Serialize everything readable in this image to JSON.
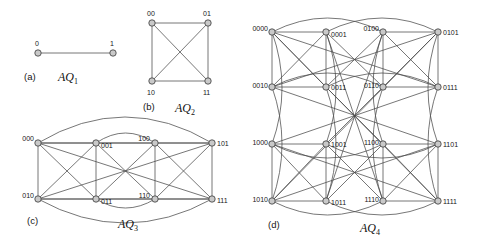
{
  "figure": {
    "background_color": "#ffffff",
    "edge_color": "#4a4a4a",
    "node_fill": "#c9c9c9",
    "node_stroke": "#3a3a3a",
    "label_color": "#161616"
  },
  "panels": [
    {
      "id": "aq1",
      "tag": "(a)",
      "name": "AQ",
      "subscript": "1",
      "dimension": 1,
      "origin": {
        "x": 0,
        "y": 0
      },
      "tag_pos": {
        "x": 24,
        "y": 80
      },
      "name_pos": {
        "x": 58,
        "y": 81
      },
      "nodes": [
        {
          "label": "0",
          "x": 38,
          "y": 53,
          "lx": 35,
          "ly": 46,
          "anchor": "start"
        },
        {
          "label": "1",
          "x": 113,
          "y": 53,
          "lx": 110,
          "ly": 46,
          "anchor": "start"
        }
      ],
      "edges": [
        {
          "from": 0,
          "to": 1,
          "bow": 0
        }
      ]
    },
    {
      "id": "aq2",
      "tag": "(b)",
      "name": "AQ",
      "subscript": "2",
      "dimension": 2,
      "origin": {
        "x": 0,
        "y": 0
      },
      "tag_pos": {
        "x": 143,
        "y": 110
      },
      "name_pos": {
        "x": 175,
        "y": 112
      },
      "nodes": [
        {
          "label": "00",
          "x": 152,
          "y": 23,
          "lx": 147,
          "ly": 16,
          "anchor": "start"
        },
        {
          "label": "01",
          "x": 208,
          "y": 23,
          "lx": 203,
          "ly": 16,
          "anchor": "start"
        },
        {
          "label": "10",
          "x": 152,
          "y": 81,
          "lx": 147,
          "ly": 95,
          "anchor": "start"
        },
        {
          "label": "11",
          "x": 208,
          "y": 81,
          "lx": 203,
          "ly": 95,
          "anchor": "start"
        }
      ],
      "edges": [
        {
          "from": 0,
          "to": 1,
          "bow": 0
        },
        {
          "from": 2,
          "to": 3,
          "bow": 0
        },
        {
          "from": 0,
          "to": 2,
          "bow": 0
        },
        {
          "from": 1,
          "to": 3,
          "bow": 0
        },
        {
          "from": 0,
          "to": 3,
          "bow": 0
        },
        {
          "from": 1,
          "to": 2,
          "bow": 0
        }
      ]
    },
    {
      "id": "aq3",
      "tag": "(c)",
      "name": "AQ",
      "subscript": "3",
      "dimension": 3,
      "origin": {
        "x": 0,
        "y": 0
      },
      "tag_pos": {
        "x": 27,
        "y": 224
      },
      "name_pos": {
        "x": 118,
        "y": 228
      },
      "nodes": [
        {
          "label": "000",
          "x": 38,
          "y": 143,
          "lx": 34,
          "ly": 141,
          "anchor": "end"
        },
        {
          "label": "001",
          "x": 96,
          "y": 143,
          "lx": 101,
          "ly": 148,
          "anchor": "start"
        },
        {
          "label": "100",
          "x": 155,
          "y": 143,
          "lx": 150,
          "ly": 141,
          "anchor": "end"
        },
        {
          "label": "101",
          "x": 212,
          "y": 143,
          "lx": 217,
          "ly": 146,
          "anchor": "start"
        },
        {
          "label": "010",
          "x": 38,
          "y": 199,
          "lx": 34,
          "ly": 198,
          "anchor": "end"
        },
        {
          "label": "011",
          "x": 96,
          "y": 199,
          "lx": 101,
          "ly": 204,
          "anchor": "start"
        },
        {
          "label": "110",
          "x": 155,
          "y": 199,
          "lx": 150,
          "ly": 198,
          "anchor": "end"
        },
        {
          "label": "111",
          "x": 212,
          "y": 199,
          "lx": 217,
          "ly": 203,
          "anchor": "start"
        }
      ],
      "edges": [
        {
          "from": 0,
          "to": 1,
          "bow": 0
        },
        {
          "from": 2,
          "to": 3,
          "bow": 0
        },
        {
          "from": 4,
          "to": 5,
          "bow": 0
        },
        {
          "from": 6,
          "to": 7,
          "bow": 0
        },
        {
          "from": 0,
          "to": 4,
          "bow": 0
        },
        {
          "from": 1,
          "to": 5,
          "bow": 0
        },
        {
          "from": 2,
          "to": 6,
          "bow": 0
        },
        {
          "from": 3,
          "to": 7,
          "bow": 0
        },
        {
          "from": 0,
          "to": 2,
          "bow": 0
        },
        {
          "from": 1,
          "to": 3,
          "bow": 0
        },
        {
          "from": 4,
          "to": 6,
          "bow": 0
        },
        {
          "from": 5,
          "to": 7,
          "bow": 0
        },
        {
          "from": 0,
          "to": 5,
          "bow": 0
        },
        {
          "from": 1,
          "to": 4,
          "bow": 0
        },
        {
          "from": 2,
          "to": 7,
          "bow": 0
        },
        {
          "from": 3,
          "to": 6,
          "bow": 0
        },
        {
          "from": 0,
          "to": 3,
          "bow": -26
        },
        {
          "from": 4,
          "to": 7,
          "bow": 24
        },
        {
          "from": 0,
          "to": 7,
          "bow": 0
        },
        {
          "from": 1,
          "to": 6,
          "bow": 0
        },
        {
          "from": 2,
          "to": 5,
          "bow": 0
        },
        {
          "from": 3,
          "to": 4,
          "bow": 0
        },
        {
          "from": 1,
          "to": 2,
          "bow": -10
        },
        {
          "from": 5,
          "to": 6,
          "bow": 9
        }
      ]
    },
    {
      "id": "aq4",
      "tag": "(d)",
      "name": "AQ",
      "subscript": "4",
      "dimension": 4,
      "origin": {
        "x": 0,
        "y": 0
      },
      "tag_pos": {
        "x": 268,
        "y": 228
      },
      "name_pos": {
        "x": 360,
        "y": 232
      },
      "nodes": [
        {
          "label": "0000",
          "x": 272,
          "y": 32,
          "lx": 268,
          "ly": 31,
          "anchor": "end"
        },
        {
          "label": "0001",
          "x": 326,
          "y": 32,
          "lx": 331,
          "ly": 37,
          "anchor": "start"
        },
        {
          "label": "0100",
          "x": 383,
          "y": 32,
          "lx": 379,
          "ly": 31,
          "anchor": "end"
        },
        {
          "label": "0101",
          "x": 438,
          "y": 32,
          "lx": 443,
          "ly": 35,
          "anchor": "start"
        },
        {
          "label": "0010",
          "x": 272,
          "y": 87,
          "lx": 268,
          "ly": 88,
          "anchor": "end"
        },
        {
          "label": "0011",
          "x": 326,
          "y": 87,
          "lx": 331,
          "ly": 90,
          "anchor": "start"
        },
        {
          "label": "0110",
          "x": 383,
          "y": 87,
          "lx": 379,
          "ly": 88,
          "anchor": "end"
        },
        {
          "label": "0111",
          "x": 438,
          "y": 87,
          "lx": 443,
          "ly": 90,
          "anchor": "start"
        },
        {
          "label": "1000",
          "x": 272,
          "y": 144,
          "lx": 268,
          "ly": 145,
          "anchor": "end"
        },
        {
          "label": "1001",
          "x": 326,
          "y": 144,
          "lx": 331,
          "ly": 147,
          "anchor": "start"
        },
        {
          "label": "1100",
          "x": 383,
          "y": 144,
          "lx": 379,
          "ly": 145,
          "anchor": "end"
        },
        {
          "label": "1101",
          "x": 438,
          "y": 144,
          "lx": 443,
          "ly": 147,
          "anchor": "start"
        },
        {
          "label": "1010",
          "x": 272,
          "y": 201,
          "lx": 268,
          "ly": 202,
          "anchor": "end"
        },
        {
          "label": "1011",
          "x": 326,
          "y": 201,
          "lx": 331,
          "ly": 205,
          "anchor": "start"
        },
        {
          "label": "1110",
          "x": 383,
          "y": 201,
          "lx": 379,
          "ly": 202,
          "anchor": "end"
        },
        {
          "label": "1111",
          "x": 438,
          "y": 201,
          "lx": 443,
          "ly": 204,
          "anchor": "start"
        }
      ],
      "edges": []
    }
  ],
  "graph_rule": {
    "family": "augmented cube",
    "description": "AQn vertices are n-bit binary strings; u~v when they differ in exactly one bit, or when a suffix of the lower bits is complemented wholesale.",
    "node_radius": 3.2
  }
}
